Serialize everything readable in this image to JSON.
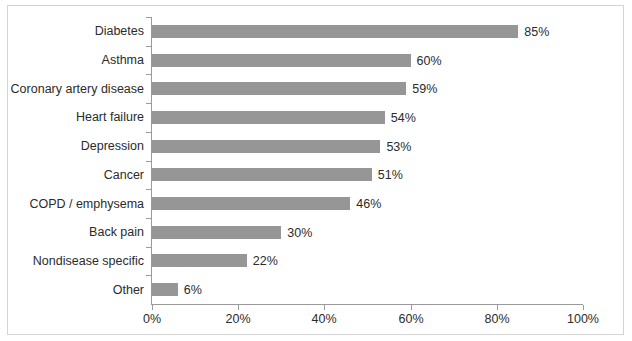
{
  "chart_data": {
    "type": "bar",
    "orientation": "horizontal",
    "title": "",
    "xlabel": "",
    "ylabel": "",
    "xlim": [
      0,
      100
    ],
    "grid": false,
    "legend": false,
    "bar_color": "#969696",
    "axis_color": "#9a9a9a",
    "text_color": "#2b2b2b",
    "border_color": "#d4d4d4",
    "categories": [
      "Diabetes",
      "Asthma",
      "Coronary artery disease",
      "Heart failure",
      "Depression",
      "Cancer",
      "COPD / emphysema",
      "Back pain",
      "Nondisease specific",
      "Other"
    ],
    "values": [
      85,
      60,
      59,
      54,
      53,
      51,
      46,
      30,
      22,
      6
    ],
    "value_labels": [
      "85%",
      "60%",
      "59%",
      "54%",
      "53%",
      "51%",
      "46%",
      "30%",
      "22%",
      "6%"
    ],
    "xticks": [
      0,
      20,
      40,
      60,
      80,
      100
    ],
    "xtick_labels": [
      "0%",
      "20%",
      "40%",
      "60%",
      "80%",
      "100%"
    ]
  }
}
